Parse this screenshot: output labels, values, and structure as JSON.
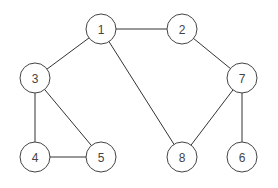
{
  "graph": {
    "nodes": [
      {
        "id": "1",
        "label": "1",
        "x": 101,
        "y": 29
      },
      {
        "id": "2",
        "label": "2",
        "x": 182,
        "y": 29
      },
      {
        "id": "3",
        "label": "3",
        "x": 35,
        "y": 78
      },
      {
        "id": "7",
        "label": "7",
        "x": 242,
        "y": 78
      },
      {
        "id": "4",
        "label": "4",
        "x": 35,
        "y": 157
      },
      {
        "id": "5",
        "label": "5",
        "x": 101,
        "y": 157
      },
      {
        "id": "8",
        "label": "8",
        "x": 182,
        "y": 157
      },
      {
        "id": "6",
        "label": "6",
        "x": 242,
        "y": 157
      }
    ],
    "edges": [
      {
        "from": "1",
        "to": "2"
      },
      {
        "from": "1",
        "to": "3"
      },
      {
        "from": "1",
        "to": "8"
      },
      {
        "from": "2",
        "to": "7"
      },
      {
        "from": "3",
        "to": "4"
      },
      {
        "from": "3",
        "to": "5"
      },
      {
        "from": "4",
        "to": "5"
      },
      {
        "from": "7",
        "to": "8"
      },
      {
        "from": "7",
        "to": "6"
      }
    ],
    "node_radius": 15,
    "colors": {
      "stroke": "#444444",
      "fill": "#ffffff",
      "text": "#444444"
    }
  }
}
